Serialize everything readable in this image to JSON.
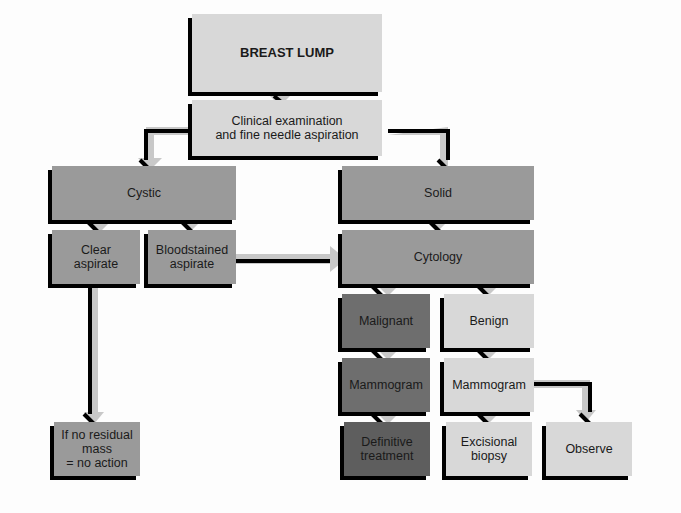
{
  "flowchart": {
    "title": "BREAST LUMP",
    "nodes": {
      "exam": "Clinical examination\nand fine needle aspiration",
      "cystic": "Cystic",
      "solid": "Solid",
      "clear": "Clear\naspirate",
      "bloodstained": "Bloodstained\naspirate",
      "cytology": "Cytology",
      "malignant": "Malignant",
      "benign": "Benign",
      "mammogram_malignant": "Mammogram",
      "mammogram_benign": "Mammogram",
      "no_action": "If no residual\nmass\n= no action",
      "definitive": "Definitive\ntreatment",
      "excisional": "Excisional\nbiopsy",
      "observe": "Observe"
    },
    "colors": {
      "light": "#d8d8d8",
      "mid": "#a9a9a9",
      "dark": "#6e6e6e",
      "shadow": "#000000"
    }
  }
}
